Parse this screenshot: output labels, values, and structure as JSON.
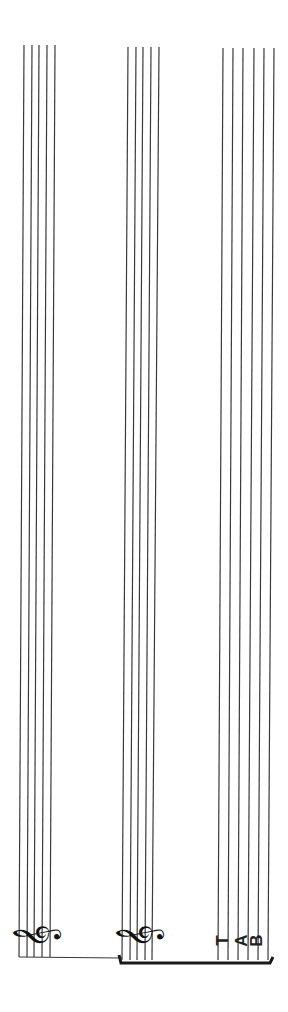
{
  "page": {
    "orientation": "rotated-90",
    "background": "#ffffff",
    "ink_color": "#3a3a3a"
  },
  "staves": [
    {
      "name": "treble-staff-1",
      "type": "standard",
      "line_count": 5,
      "clef": "treble",
      "clef_glyph": "𝄞"
    },
    {
      "name": "treble-staff-2",
      "type": "standard",
      "line_count": 5,
      "clef": "treble",
      "clef_glyph": "𝄞"
    },
    {
      "name": "tab-staff",
      "type": "tablature",
      "line_count": 6,
      "clef": "tab",
      "clef_letters": [
        "T",
        "A",
        "B"
      ]
    }
  ],
  "bracket": {
    "groups": [
      "treble-staff-2",
      "tab-staff"
    ]
  }
}
